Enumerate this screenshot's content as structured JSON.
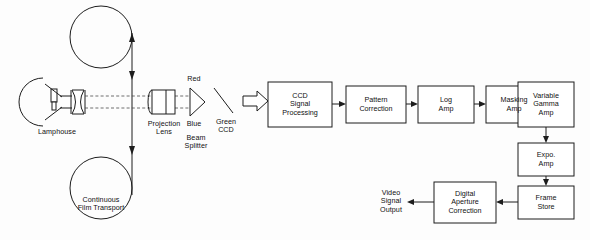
{
  "diagram": {
    "background_color": "#fdfdfd",
    "line_color": "#1d1d1d",
    "box_fill": "#ffffff"
  },
  "optical": {
    "lamphouse_label": "Lamphouse",
    "film_transport_label": "Continuous\nFilm Transport",
    "projection_lens_label": "Projection\nLens",
    "red_label": "Red",
    "blue_label": "Blue",
    "beam_splitter_label": "Beam\nSplitter",
    "green_ccd_label": "Green\nCCD"
  },
  "chain": {
    "boxes": [
      {
        "id": "ccd-signal-processing",
        "label": "CCD\nSignal\nProcessing",
        "x": 268,
        "y": 82,
        "w": 64,
        "h": 45
      },
      {
        "id": "pattern-correction",
        "label": "Pattern\nCorrection",
        "x": 346,
        "y": 86,
        "w": 60,
        "h": 37
      },
      {
        "id": "log-amp",
        "label": "Log\nAmp",
        "x": 418,
        "y": 86,
        "w": 56,
        "h": 37
      },
      {
        "id": "masking-amp",
        "label": "Masking\nAmp",
        "x": 486,
        "y": 86,
        "w": 56,
        "h": 37
      },
      {
        "id": "variable-gamma-amp",
        "label": "Variable\nGamma\nAmp",
        "x": 518,
        "y": 82,
        "w": 56,
        "h": 45
      },
      {
        "id": "expo-amp",
        "label": "Expo.\nAmp",
        "x": 518,
        "y": 143,
        "w": 56,
        "h": 33
      },
      {
        "id": "frame-store",
        "label": "Frame\nStore",
        "x": 518,
        "y": 186,
        "w": 56,
        "h": 33
      },
      {
        "id": "digital-aperture-correction",
        "label": "Digital\nAperture\nCorrection",
        "x": 434,
        "y": 182,
        "w": 62,
        "h": 41
      }
    ],
    "output_label": "Video\nSignal\nOutput"
  }
}
